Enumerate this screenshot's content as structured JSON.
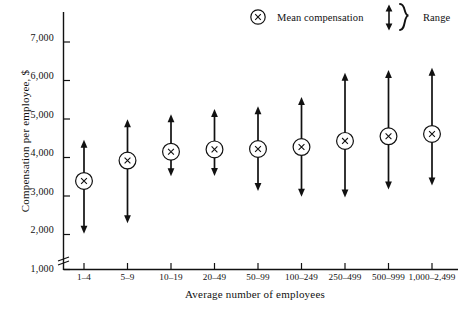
{
  "chart_data": {
    "type": "scatter",
    "title": "",
    "xlabel": "Average number of employees",
    "ylabel": "Compensation per employee, $",
    "ylim": [
      1000,
      7600
    ],
    "yticks": [
      1000,
      2000,
      3000,
      4000,
      5000,
      6000,
      7000
    ],
    "ytick_labels": [
      "1,000",
      "2,000",
      "3,000",
      "4,000",
      "5,000",
      "6,000",
      "7,000"
    ],
    "y_axis_break": true,
    "grid": false,
    "legend_position": "top-right",
    "categories": [
      "1–4",
      "5–9",
      "10–19",
      "20–49",
      "50–99",
      "100–249",
      "250–499",
      "500–999",
      "1,000–2,499"
    ],
    "series": [
      {
        "name": "Mean compensation",
        "marker": "circled-x",
        "values": [
          3300,
          3830,
          4060,
          4120,
          4130,
          4180,
          4340,
          4460,
          4520
        ]
      },
      {
        "name": "Range",
        "marker": "double-arrow",
        "upper": [
          4370,
          4900,
          5030,
          5170,
          5240,
          5480,
          6110,
          6180,
          6240
        ],
        "lower": [
          1930,
          2200,
          3420,
          3430,
          3040,
          2890,
          2870,
          3080,
          3180
        ]
      }
    ]
  },
  "legend": {
    "mean_label": "Mean compensation",
    "range_label": "Range",
    "mean_icon": "circled-x-icon",
    "range_icon": "double-headed-arrow-icon",
    "brace_icon": "curly-brace-icon"
  },
  "axes": {
    "y_label": "Compensation per employee, $",
    "x_label": "Average number of employees",
    "y_break_icon": "axis-break-icon"
  },
  "colors": {
    "ink": "#111111",
    "background": "#ffffff"
  }
}
